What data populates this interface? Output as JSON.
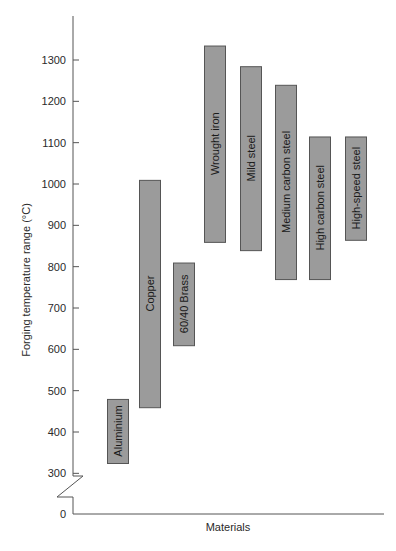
{
  "chart_data": {
    "type": "bar",
    "subtype": "floating-range",
    "title": "",
    "xlabel": "Materials",
    "ylabel": "Forging temperature range (°C)",
    "ylim": [
      0,
      1350
    ],
    "axis_break": {
      "from": 0,
      "to": 300
    },
    "yticks": [
      0,
      300,
      400,
      500,
      600,
      700,
      800,
      900,
      1000,
      1100,
      1200,
      1300
    ],
    "grid": false,
    "legend": null,
    "bar_color": "#9b9b9b",
    "bar_edge_color": "#555555",
    "categories": [
      "Aluminium",
      "Copper",
      "60/40 Brass",
      "Wrought iron",
      "Mild steel",
      "Medium carbon steel",
      "High carbon steel",
      "High-speed steel"
    ],
    "series": [
      {
        "name": "min",
        "values": [
          325,
          460,
          610,
          860,
          840,
          770,
          770,
          865
        ]
      },
      {
        "name": "max",
        "values": [
          480,
          1010,
          810,
          1335,
          1285,
          1240,
          1115,
          1115
        ]
      }
    ]
  }
}
